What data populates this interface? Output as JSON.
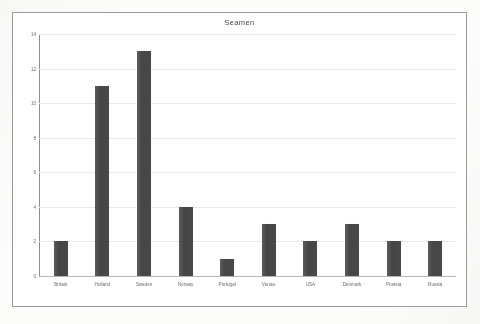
{
  "document": {
    "kind": "scanned-bar-chart-page"
  },
  "chart": {
    "title": "Seamen",
    "frame_border_color": "#9a9a9a",
    "bar_color": "#4a4a4a",
    "gridline_color": "#e9e9e9",
    "axis_color": "#8e8e8e"
  },
  "chart_data": {
    "type": "bar",
    "title": "Seamen",
    "xlabel": "",
    "ylabel": "",
    "categories": [
      "Britain",
      "Holland",
      "Sweden",
      "Norway",
      "Portugal",
      "Venice",
      "USA",
      "Denmark",
      "Prussia",
      "Russia"
    ],
    "values": [
      2,
      11,
      13,
      4,
      1,
      3,
      2,
      3,
      2,
      2
    ],
    "ylim": [
      0,
      14
    ],
    "ytick_values": [
      0,
      2,
      4,
      6,
      8,
      10,
      12,
      14
    ],
    "ytick_labels": [
      "0",
      "2",
      "4",
      "6",
      "8",
      "10",
      "12",
      "14"
    ],
    "grid": true,
    "legend": false,
    "legend_position": "none"
  }
}
